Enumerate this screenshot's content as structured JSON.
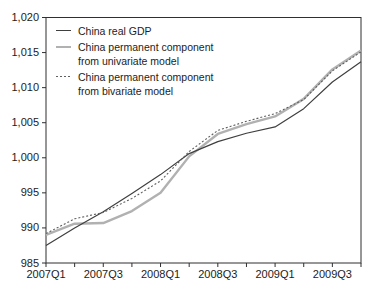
{
  "figure": {
    "background_color": "#ffffff",
    "axis_color": "#2f2f2f",
    "text_color": "#1c1c1c"
  },
  "chart_data": {
    "type": "line",
    "title": "",
    "xlabel": "",
    "ylabel": "",
    "x_categories": [
      "2007Q1",
      "2007Q2",
      "2007Q3",
      "2007Q4",
      "2008Q1",
      "2008Q2",
      "2008Q3",
      "2008Q4",
      "2009Q1",
      "2009Q2",
      "2009Q3",
      "2009Q4"
    ],
    "x_labeled_indices": [
      0,
      2,
      4,
      6,
      8,
      10
    ],
    "x_tick_labels": [
      "2007Q1",
      "2007Q3",
      "2008Q1",
      "2008Q3",
      "2009Q1",
      "2009Q3"
    ],
    "ylim": [
      985,
      1020
    ],
    "y_ticks": [
      985,
      990,
      995,
      1000,
      1005,
      1010,
      1015,
      1020
    ],
    "y_tick_labels": [
      "985",
      "990",
      "995",
      "1,000",
      "1,005",
      "1,010",
      "1,015",
      "1,020"
    ],
    "grid": false,
    "legend_position": "top-left-inside",
    "draw_order": [
      1,
      0,
      2
    ],
    "series": [
      {
        "name": "China real GDP",
        "color": "#3f3f3f",
        "line_width": 1.2,
        "dash": "solid",
        "values": [
          987.5,
          990.0,
          992.3,
          994.9,
          997.6,
          1000.6,
          1002.3,
          1003.5,
          1004.4,
          1007.0,
          1010.8,
          1013.7
        ]
      },
      {
        "name": "China permanent component from univariate model",
        "color": "#b1b1b1",
        "line_width": 2.4,
        "dash": "solid",
        "values": [
          989.0,
          990.6,
          990.7,
          992.4,
          995.0,
          1000.2,
          1003.4,
          1004.8,
          1005.9,
          1008.4,
          1012.6,
          1015.3
        ]
      },
      {
        "name": "China permanent component from bivariate model",
        "color": "#5f5f5f",
        "line_width": 1.1,
        "dash": "2 2",
        "values": [
          989.2,
          991.3,
          992.2,
          994.2,
          996.7,
          1000.9,
          1003.9,
          1005.2,
          1006.3,
          1008.3,
          1012.4,
          1015.1
        ]
      }
    ]
  }
}
